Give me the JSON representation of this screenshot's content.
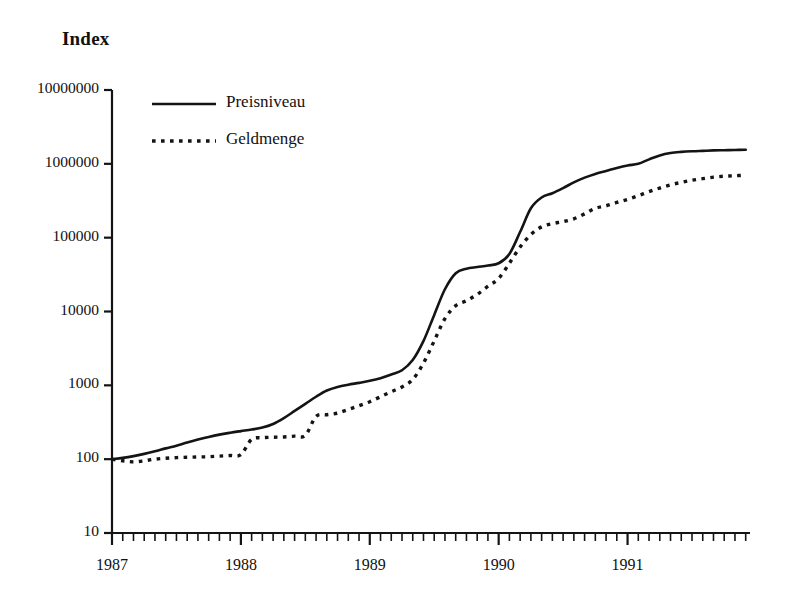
{
  "chart_data": {
    "type": "line",
    "title": "",
    "ylabel": "Index",
    "xlabel": "",
    "yscale": "log",
    "ylim": [
      10,
      10000000
    ],
    "grid": false,
    "legend_position": "top-left",
    "y_tick_labels": [
      "10000000",
      "1000000",
      "100000",
      "10000",
      "1000",
      "100",
      "10"
    ],
    "y_tick_values": [
      10000000,
      1000000,
      100000,
      10000,
      1000,
      100,
      10
    ],
    "x_tick_labels": [
      "1987",
      "1988",
      "1989",
      "1990",
      "1991"
    ],
    "x_tick_values": [
      1987,
      1988,
      1989,
      1990,
      1991
    ],
    "x_minor_ticks": "monthly",
    "x_range": [
      1987.0,
      1991.95
    ],
    "series": [
      {
        "name": "Preisniveau",
        "style": "solid",
        "color": "#141414",
        "x": [
          1987.0,
          1987.083,
          1987.167,
          1987.25,
          1987.333,
          1987.417,
          1987.5,
          1987.583,
          1987.667,
          1987.75,
          1987.833,
          1987.917,
          1988.0,
          1988.083,
          1988.167,
          1988.25,
          1988.333,
          1988.417,
          1988.5,
          1988.583,
          1988.667,
          1988.75,
          1988.833,
          1988.917,
          1989.0,
          1989.083,
          1989.167,
          1989.25,
          1989.333,
          1989.417,
          1989.5,
          1989.583,
          1989.667,
          1989.75,
          1989.833,
          1989.917,
          1990.0,
          1990.083,
          1990.167,
          1990.25,
          1990.333,
          1990.417,
          1990.5,
          1990.583,
          1990.667,
          1990.75,
          1990.833,
          1990.917,
          1991.0,
          1991.083,
          1991.167,
          1991.25,
          1991.333,
          1991.417,
          1991.5,
          1991.583,
          1991.667,
          1991.75,
          1991.833,
          1991.917
        ],
        "y": [
          100,
          104,
          110,
          118,
          128,
          140,
          152,
          168,
          184,
          200,
          215,
          228,
          240,
          252,
          268,
          300,
          360,
          450,
          560,
          700,
          850,
          950,
          1020,
          1080,
          1150,
          1250,
          1400,
          1600,
          2200,
          4000,
          9000,
          20000,
          33000,
          38000,
          40000,
          42000,
          45000,
          60000,
          120000,
          250000,
          350000,
          400000,
          470000,
          560000,
          650000,
          730000,
          800000,
          880000,
          950000,
          1000000,
          1150000,
          1300000,
          1400000,
          1450000,
          1480000,
          1500000,
          1520000,
          1530000,
          1540000,
          1550000
        ]
      },
      {
        "name": "Geldmenge",
        "style": "dotted",
        "color": "#141414",
        "x": [
          1987.0,
          1987.083,
          1987.167,
          1987.25,
          1987.333,
          1987.417,
          1987.5,
          1987.583,
          1987.667,
          1987.75,
          1987.833,
          1987.917,
          1988.0,
          1988.083,
          1988.167,
          1988.25,
          1988.333,
          1988.417,
          1988.5,
          1988.583,
          1988.667,
          1988.75,
          1988.833,
          1988.917,
          1989.0,
          1989.083,
          1989.167,
          1989.25,
          1989.333,
          1989.417,
          1989.5,
          1989.583,
          1989.667,
          1989.75,
          1989.833,
          1989.917,
          1990.0,
          1990.083,
          1990.167,
          1990.25,
          1990.333,
          1990.417,
          1990.5,
          1990.583,
          1990.667,
          1990.75,
          1990.833,
          1990.917,
          1991.0,
          1991.083,
          1991.167,
          1991.25,
          1991.333,
          1991.417,
          1991.5,
          1991.583,
          1991.667,
          1991.75,
          1991.833,
          1991.917
        ],
        "y": [
          100,
          95,
          92,
          95,
          100,
          103,
          105,
          106,
          107,
          108,
          110,
          112,
          115,
          185,
          195,
          198,
          200,
          205,
          210,
          380,
          400,
          420,
          470,
          530,
          600,
          700,
          820,
          950,
          1200,
          2000,
          4000,
          8000,
          12000,
          14000,
          17000,
          22000,
          28000,
          45000,
          75000,
          110000,
          140000,
          155000,
          165000,
          180000,
          210000,
          250000,
          270000,
          300000,
          330000,
          370000,
          420000,
          470000,
          520000,
          560000,
          600000,
          630000,
          660000,
          680000,
          690000,
          700000
        ]
      }
    ]
  },
  "legend": {
    "items": [
      {
        "label": "Preisniveau",
        "style": "solid"
      },
      {
        "label": "Geldmenge",
        "style": "dotted"
      }
    ]
  }
}
